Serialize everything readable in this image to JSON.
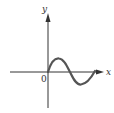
{
  "diagram": {
    "type": "function-graph",
    "labels": {
      "x_axis": "x",
      "y_axis": "y",
      "origin": "0"
    },
    "curve": {
      "description": "one period of sine-like wave starting at origin, rising to a peak, descending through zero, reaching a trough, then rising back toward the x-axis",
      "color": "#555555"
    },
    "colors": {
      "axis": "#333333",
      "curve": "#555555",
      "background": "#ffffff"
    }
  }
}
